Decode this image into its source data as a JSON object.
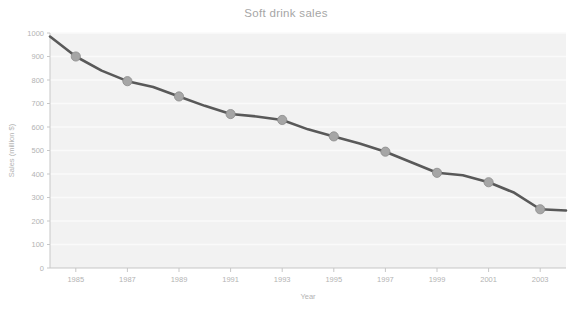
{
  "chart_data": {
    "type": "line",
    "title": "Soft drink sales",
    "xlabel": "Year",
    "ylabel": "Sales (million $)",
    "x": [
      1984,
      1985,
      1986,
      1987,
      1988,
      1989,
      1990,
      1991,
      1992,
      1993,
      1994,
      1995,
      1996,
      1997,
      1998,
      1999,
      2000,
      2001,
      2002,
      2003,
      2004
    ],
    "values": [
      985,
      900,
      840,
      795,
      770,
      730,
      690,
      655,
      645,
      630,
      590,
      560,
      530,
      495,
      450,
      405,
      395,
      365,
      320,
      250,
      245
    ],
    "marker_x": [
      1985,
      1987,
      1989,
      1991,
      1993,
      1995,
      1997,
      1999,
      2001,
      2003
    ],
    "marker_values": [
      900,
      795,
      730,
      655,
      630,
      560,
      495,
      405,
      365,
      250
    ],
    "xtick_labels": [
      "1985",
      "1987",
      "1989",
      "1991",
      "1993",
      "1995",
      "1997",
      "1999",
      "2001",
      "2003"
    ],
    "xticks": [
      1985,
      1987,
      1989,
      1991,
      1993,
      1995,
      1997,
      1999,
      2001,
      2003
    ],
    "ytick_labels": [
      "0",
      "100",
      "200",
      "300",
      "400",
      "500",
      "600",
      "700",
      "800",
      "900",
      "1000"
    ],
    "yticks": [
      0,
      100,
      200,
      300,
      400,
      500,
      600,
      700,
      800,
      900,
      1000
    ],
    "ylim": [
      0,
      1000
    ],
    "xlim": [
      1984,
      2004
    ],
    "grid": true,
    "grid_axis": "y",
    "legend": "none",
    "series": [
      {
        "name": "Soft drink sales",
        "values": [
          985,
          900,
          840,
          795,
          770,
          730,
          690,
          655,
          645,
          630,
          590,
          560,
          530,
          495,
          450,
          405,
          395,
          365,
          320,
          250,
          245
        ]
      }
    ],
    "colors": {
      "line": "#595959",
      "marker_fill": "#a6a6a6",
      "marker_edge": "#8c8c8c",
      "plot_background": "#f2f2f2",
      "gridline": "#fafafa",
      "axis": "#c7c7c7",
      "tick_text": "#b3b3b3",
      "title_text": "#a6a6a6",
      "figure_background": "#ffffff"
    }
  }
}
